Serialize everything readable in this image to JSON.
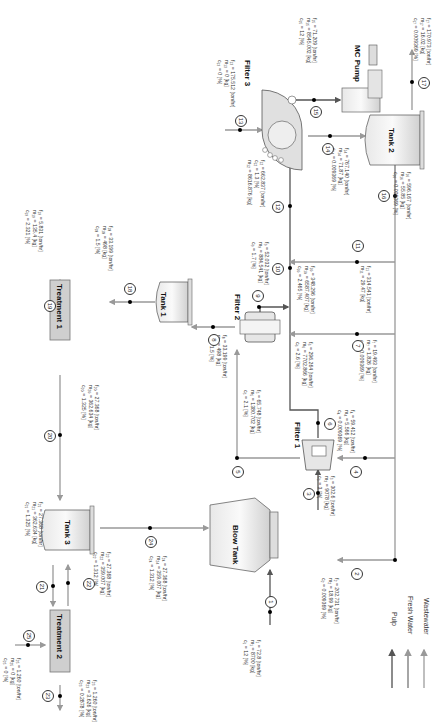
{
  "units": {
    "blow_tank": "Blow Tank",
    "filter1": "Filter 1",
    "filter2": "Filter 2",
    "filter3": "Filter 3",
    "tank1": "Tank 1",
    "tank2": "Tank 2",
    "tank3": "Tank 3",
    "treatment1": "Treatment 1",
    "treatment2": "Treatment 2",
    "mc_pump": "MC Pump"
  },
  "streams": [
    {
      "id": "1",
      "lines": [
        "f₁ = 72.8 [ton/hr]",
        "m₁ = 8700 [kg]",
        "c₁ = 12 [%]"
      ]
    },
    {
      "id": "2",
      "lines": [
        "f₂ = 202.731 [ton/hr]",
        "m₂ = 18.99 [kg]",
        "c₂ = 0.009369 [%]"
      ]
    },
    {
      "id": "3",
      "lines": [
        "f₃ = 302.6 [ton/hr]",
        "m₃ = 9078 [kg]",
        "c₃ = 3 [%]"
      ]
    },
    {
      "id": "4",
      "lines": [
        "f₄ = 59.412 [ton/hr]",
        "m₄ = 5.566 [kg]",
        "c₄ = 0.009369 [%]"
      ]
    },
    {
      "id": "5",
      "lines": [
        "f₅ = 65.748 [ton/hr]",
        "m₅ = 1380.702 [kg]",
        "c₅ = 2.1 [%]"
      ]
    },
    {
      "id": "6",
      "lines": [
        "f₆ = 296.264 [ton/hr]",
        "m₆ = 7702.866 [kg]",
        "c₆ = 2.6 [%]"
      ]
    },
    {
      "id": "7",
      "lines": [
        "f₇ = 19.493 [ton/hr]",
        "m₇ = 1.826 [kg]",
        "c₇ = 0.009369 [%]"
      ]
    },
    {
      "id": "8",
      "lines": [
        "f₈ = 33.199 [ton/hr]",
        "m₈ = 498 [kg]",
        "c₈ = 1.5 [%]"
      ]
    },
    {
      "id": "9",
      "lines": [
        "f₉ = 52.032 [ton/hr]",
        "m₉ = 884.541 [kg]",
        "c₉ = 1.7 [%]"
      ]
    },
    {
      "id": "10",
      "lines": [
        "f₁₀ = 348.296 [ton/hr]",
        "m₁₀ = 6587.407 [kg]",
        "c₁₀ = 2.465 [%]"
      ]
    },
    {
      "id": "11",
      "lines": [
        "f₁₁ = 314.541 [ton/hr]",
        "m₁₁ = 29.47 [kg]"
      ]
    },
    {
      "id": "12",
      "lines": [
        "f₁₂ = 662.837 [ton/hr]",
        "c₁₂ = 1.3 [%]",
        "m₁₂ = 8616.876 [kg]"
      ]
    },
    {
      "id": "13",
      "lines": [
        "f₁₃ = 175.512 [ton/hr]",
        "m₁₃ = 0 [kg]",
        "c₁₃ = 0 [%]"
      ]
    },
    {
      "id": "14",
      "lines": [
        "f₁₄ = 767.140 [ton/hr]",
        "m₁₄ = 71.87 [kg]",
        "c₁₄ = 0.009369 [%]"
      ]
    },
    {
      "id": "15",
      "lines": [
        "f₁₅ = 71.209 [ton/hr]",
        "m₁₅ = 8545.002 [kg]",
        "c₁₅ = 12 [%]"
      ]
    },
    {
      "id": "16",
      "lines": [
        "f₁₆ = 596.167 [ton/hr]",
        "m₁₆ = 55.85 [kg]",
        "c₁₆ = 0.009369 [%]"
      ]
    },
    {
      "id": "17",
      "lines": [
        "f₁₇ = 170.973 [ton/hr]",
        "m₁₇ = 16.02 [kg]",
        "c₁₇ = 0.009369 [%]"
      ]
    },
    {
      "id": "18",
      "lines": [
        "f₁₈ = 33.199 [ton/hr]",
        "m₁₈ = 498 [kg]",
        "c₁₈ = 1.5 [%]"
      ]
    },
    {
      "id": "19",
      "lines": [
        "f₁₉ = 5.831 [ton/hr]",
        "m₁₉ = 135.4 [kg]",
        "c₁₉ = 2.321 [%]"
      ]
    },
    {
      "id": "20",
      "lines": [
        "f₂₀ = 27.368 [ton/hr]",
        "m₂₀ = 362.634 [kg]",
        "c₂₀ = 1.325 [%]"
      ]
    },
    {
      "id": "21",
      "lines": [
        "f₂₁ = 27.368 [ton/hr]",
        "m₂₁ = 362.634 [kg]",
        "c₂₁ = 1.325 [%]"
      ]
    },
    {
      "id": "22",
      "lines": [
        "f₂₂ = 27.368 [ton/hr]",
        "m₂₂ = 359.007 [kg]",
        "c₂₂ = 1.312 [%]"
      ]
    },
    {
      "id": "23",
      "lines": [
        "f₂₃ = 1.260 [ton/hr]",
        "m₂₃ = 3.626 [kg]",
        "c₂₃ = 0.2878 [%]"
      ]
    },
    {
      "id": "24",
      "lines": [
        "f₂₄ = 27.368 [ton/hr]",
        "m₂₄ = 359.007 [kg]",
        "c₂₄ = 1.312 [%]"
      ]
    },
    {
      "id": "25",
      "lines": [
        "f₂₅ = 1.260 [ton/hr]",
        "m₂₅ = 0 [kg]",
        "c₂₅ = 0 [%]"
      ]
    }
  ],
  "legend": [
    {
      "label": "Pulp",
      "color": "#666666"
    },
    {
      "label": "Fresh Water",
      "color": "#888888"
    },
    {
      "label": "Wastewater",
      "color": "#aaaaaa"
    }
  ],
  "caption": "Representation of the pulp washing process: forward rotation of the diagram"
}
